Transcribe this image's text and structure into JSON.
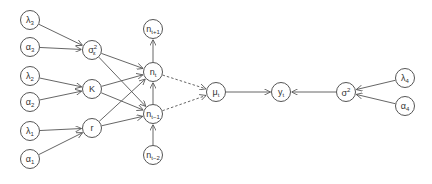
{
  "diagram": {
    "type": "directed-graphical-model",
    "nodes": [
      {
        "id": "lambda3",
        "base": "λ",
        "sub": "3",
        "sup": "",
        "x": 30,
        "y": 20
      },
      {
        "id": "alpha3",
        "base": "α",
        "sub": "3",
        "sup": "",
        "x": 30,
        "y": 47
      },
      {
        "id": "lambda2",
        "base": "λ",
        "sub": "2",
        "sup": "",
        "x": 30,
        "y": 76
      },
      {
        "id": "alpha2",
        "base": "α",
        "sub": "2",
        "sup": "",
        "x": 30,
        "y": 102
      },
      {
        "id": "lambda1",
        "base": "λ",
        "sub": "1",
        "sup": "",
        "x": 30,
        "y": 131
      },
      {
        "id": "alpha1",
        "base": "α",
        "sub": "1",
        "sup": "",
        "x": 30,
        "y": 159
      },
      {
        "id": "sigma_eps",
        "base": "σ",
        "sub": "ε",
        "sup": "2",
        "x": 92,
        "y": 50
      },
      {
        "id": "K",
        "base": "K",
        "sub": "",
        "sup": "",
        "x": 92,
        "y": 89
      },
      {
        "id": "r",
        "base": "r",
        "sub": "",
        "sup": "",
        "x": 92,
        "y": 128
      },
      {
        "id": "n_t_plus_1",
        "base": "n",
        "sub": "t+1",
        "sup": "",
        "x": 153,
        "y": 29
      },
      {
        "id": "n_t",
        "base": "n",
        "sub": "t",
        "sup": "",
        "x": 153,
        "y": 72
      },
      {
        "id": "n_t_minus_1",
        "base": "n",
        "sub": "t−1",
        "sup": "",
        "x": 153,
        "y": 114
      },
      {
        "id": "n_t_minus_2",
        "base": "n",
        "sub": "t−2",
        "sup": "",
        "x": 153,
        "y": 155
      },
      {
        "id": "mu_t",
        "base": "μ",
        "sub": "t",
        "sup": "",
        "x": 216,
        "y": 92
      },
      {
        "id": "y_t",
        "base": "y",
        "sub": "t",
        "sup": "",
        "x": 281,
        "y": 92
      },
      {
        "id": "sigma2",
        "base": "σ",
        "sub": "",
        "sup": "2",
        "x": 346,
        "y": 92
      },
      {
        "id": "lambda4",
        "base": "λ",
        "sub": "4",
        "sup": "",
        "x": 405,
        "y": 78
      },
      {
        "id": "alpha4",
        "base": "α",
        "sub": "4",
        "sup": "",
        "x": 405,
        "y": 106
      }
    ],
    "edges": [
      {
        "from": "lambda3",
        "to": "sigma_eps",
        "style": "solid"
      },
      {
        "from": "alpha3",
        "to": "sigma_eps",
        "style": "solid"
      },
      {
        "from": "lambda2",
        "to": "K",
        "style": "solid"
      },
      {
        "from": "alpha2",
        "to": "K",
        "style": "solid"
      },
      {
        "from": "lambda1",
        "to": "r",
        "style": "solid"
      },
      {
        "from": "alpha1",
        "to": "r",
        "style": "solid"
      },
      {
        "from": "sigma_eps",
        "to": "n_t",
        "style": "solid"
      },
      {
        "from": "sigma_eps",
        "to": "n_t_minus_1",
        "style": "solid"
      },
      {
        "from": "K",
        "to": "n_t",
        "style": "solid"
      },
      {
        "from": "K",
        "to": "n_t_minus_1",
        "style": "solid"
      },
      {
        "from": "r",
        "to": "n_t",
        "style": "solid"
      },
      {
        "from": "r",
        "to": "n_t_minus_1",
        "style": "solid"
      },
      {
        "from": "n_t",
        "to": "n_t_plus_1",
        "style": "solid"
      },
      {
        "from": "n_t_minus_1",
        "to": "n_t",
        "style": "solid"
      },
      {
        "from": "n_t_minus_2",
        "to": "n_t_minus_1",
        "style": "solid"
      },
      {
        "from": "n_t",
        "to": "mu_t",
        "style": "dashed"
      },
      {
        "from": "n_t_minus_1",
        "to": "mu_t",
        "style": "dashed"
      },
      {
        "from": "mu_t",
        "to": "y_t",
        "style": "solid"
      },
      {
        "from": "sigma2",
        "to": "y_t",
        "style": "solid"
      },
      {
        "from": "lambda4",
        "to": "sigma2",
        "style": "solid"
      },
      {
        "from": "alpha4",
        "to": "sigma2",
        "style": "solid"
      }
    ],
    "colors": {
      "stroke": "#555555",
      "text": "#333333",
      "background": "#ffffff"
    }
  }
}
